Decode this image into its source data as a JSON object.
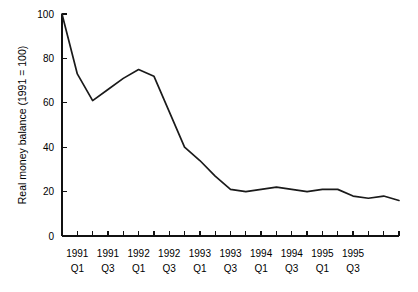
{
  "chart_data": {
    "type": "line",
    "title": "",
    "xlabel": "",
    "ylabel": "Real money balance (1991 = 100)",
    "ylim": [
      0,
      100
    ],
    "yticks": [
      0,
      20,
      40,
      60,
      80,
      100
    ],
    "grid": false,
    "legend": "none",
    "line_color": "#1a1a1a",
    "background_color": "#ffffff",
    "x": [
      "1990 Q4",
      "1991 Q1",
      "1991 Q2",
      "1991 Q3",
      "1991 Q4",
      "1992 Q1",
      "1992 Q2",
      "1992 Q3",
      "1992 Q4",
      "1993 Q1",
      "1993 Q2",
      "1993 Q3",
      "1993 Q4",
      "1994 Q1",
      "1994 Q2",
      "1994 Q3",
      "1994 Q4",
      "1995 Q1",
      "1995 Q2",
      "1995 Q3",
      "1995 Q4",
      "1996 Q1",
      "1996 Q2"
    ],
    "xtick_labels": [
      "",
      "1991 Q1",
      "",
      "1991 Q3",
      "",
      "1992 Q1",
      "",
      "1992 Q3",
      "",
      "1993 Q1",
      "",
      "1993 Q3",
      "",
      "1994 Q1",
      "",
      "1994 Q3",
      "",
      "1995 Q1",
      "",
      "1995 Q3",
      "",
      "",
      ""
    ],
    "xtick_labels_visible": [
      {
        "year": "1991",
        "quarter": "Q1"
      },
      {
        "year": "1991",
        "quarter": "Q3"
      },
      {
        "year": "1992",
        "quarter": "Q1"
      },
      {
        "year": "1992",
        "quarter": "Q3"
      },
      {
        "year": "1993",
        "quarter": "Q1"
      },
      {
        "year": "1993",
        "quarter": "Q3"
      },
      {
        "year": "1994",
        "quarter": "Q1"
      },
      {
        "year": "1994",
        "quarter": "Q3"
      },
      {
        "year": "1995",
        "quarter": "Q1"
      },
      {
        "year": "1995",
        "quarter": "Q3"
      }
    ],
    "values": [
      100,
      73,
      61,
      66,
      71,
      75,
      72,
      56,
      40,
      34,
      27,
      21,
      20,
      21,
      22,
      21,
      20,
      21,
      21,
      18,
      17,
      18,
      16
    ]
  }
}
